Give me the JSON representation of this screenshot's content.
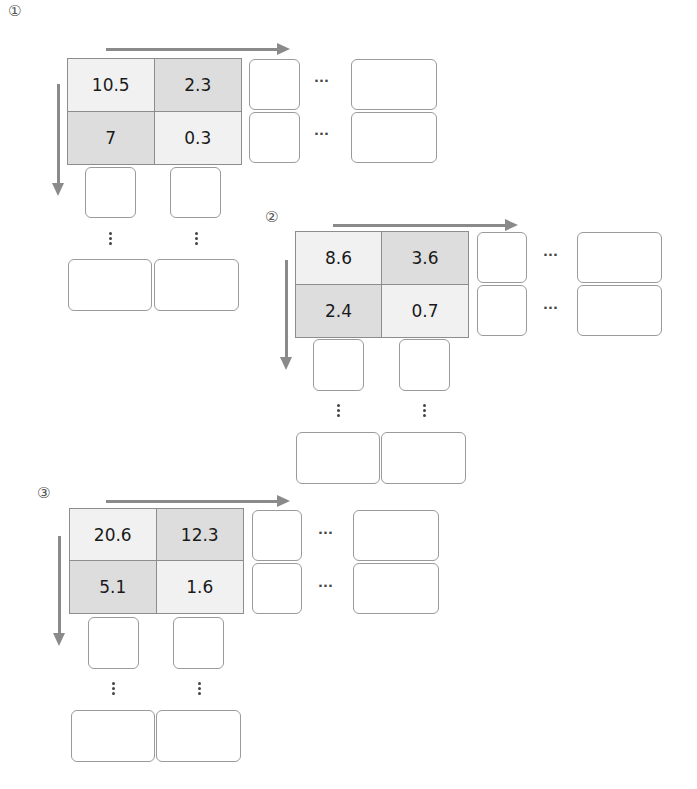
{
  "diagrams": [
    {
      "label": "①",
      "cells": [
        {
          "value": "10.5",
          "shade": "light"
        },
        {
          "value": "2.3",
          "shade": "dark"
        },
        {
          "value": "7",
          "shade": "dark"
        },
        {
          "value": "0.3",
          "shade": "light"
        }
      ],
      "row_ellipsis": [
        "···",
        "···"
      ]
    },
    {
      "label": "②",
      "cells": [
        {
          "value": "8.6",
          "shade": "light"
        },
        {
          "value": "3.6",
          "shade": "dark"
        },
        {
          "value": "2.4",
          "shade": "dark"
        },
        {
          "value": "0.7",
          "shade": "light"
        }
      ],
      "row_ellipsis": [
        "···",
        "···"
      ]
    },
    {
      "label": "③",
      "cells": [
        {
          "value": "20.6",
          "shade": "light"
        },
        {
          "value": "12.3",
          "shade": "dark"
        },
        {
          "value": "5.1",
          "shade": "dark"
        },
        {
          "value": "1.6",
          "shade": "light"
        }
      ],
      "row_ellipsis": [
        "···",
        "···"
      ]
    }
  ],
  "colors": {
    "arrow": "#8a8a8a",
    "cell_light": "#f1f1f1",
    "cell_dark": "#dddddd",
    "box_border": "#9a9a9a"
  }
}
